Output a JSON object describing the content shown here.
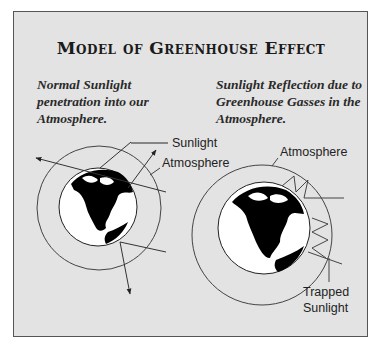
{
  "title": "Model of Greenhouse Effect",
  "captions": {
    "left": "Normal Sunlight penetration into our Atmosphere.",
    "right": "Sunlight Reflection due to Greenhouse Gasses in the Atmosphere."
  },
  "left_diagram": {
    "labels": {
      "sunlight": "Sunlight",
      "atmosphere": "Atmosphere"
    }
  },
  "right_diagram": {
    "labels": {
      "atmosphere": "Atmosphere",
      "trapped_line1": "Trapped",
      "trapped_line2": "Sunlight"
    }
  },
  "colors": {
    "panel_bg": "#e3e3e3",
    "line": "#333333",
    "globe_ocean": "#ffffff",
    "globe_land": "#000000"
  }
}
